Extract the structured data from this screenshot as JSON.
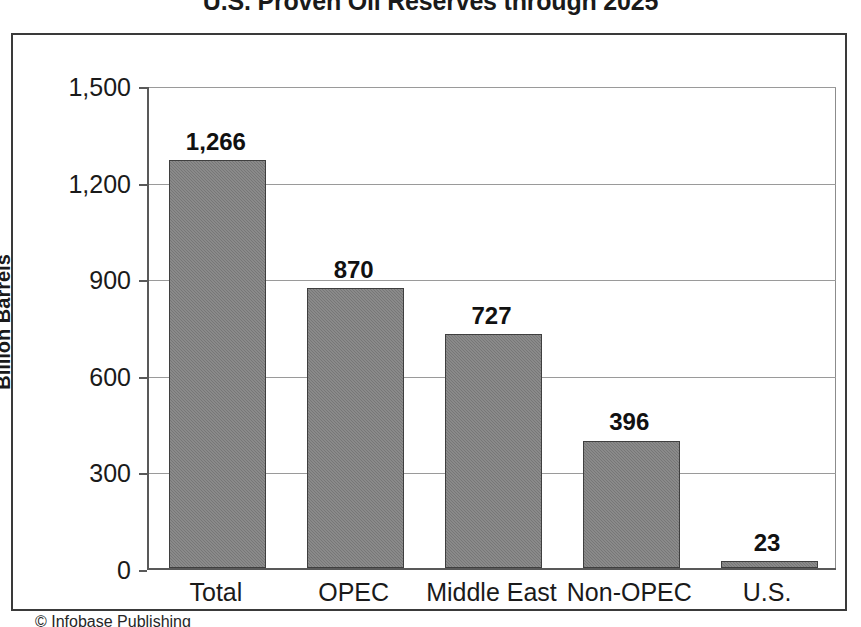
{
  "figure": {
    "credit": "© Infobase Publishing"
  },
  "chart_data": {
    "type": "bar",
    "title": "U.S. Proven Oil Reserves through 2025",
    "xlabel": "",
    "ylabel": "Billion Barrels",
    "categories": [
      "Total",
      "OPEC",
      "Middle East",
      "Non-OPEC",
      "U.S."
    ],
    "values": [
      1266,
      727,
      870,
      396,
      23
    ],
    "value_labels": [
      "1,266",
      "870",
      "727",
      "396",
      "23"
    ],
    "series": [
      {
        "name": "Proven Oil Reserves",
        "values": [
          1266,
          870,
          727,
          396,
          23
        ]
      }
    ],
    "ylim": [
      0,
      1500
    ],
    "yticks": [
      0,
      300,
      600,
      900,
      1200,
      1500
    ],
    "ytick_labels": [
      "0",
      "300",
      "600",
      "900",
      "1,200",
      "1,500"
    ],
    "grid": true,
    "legend": "none",
    "bar_color": "#7d7d7d",
    "bar_edge_color": "#3f3f3f",
    "plot_background": "#ffffff",
    "gridline_color": "#9a9a9a",
    "axis_color": "#595959",
    "text_color": "#1a1a1a"
  }
}
